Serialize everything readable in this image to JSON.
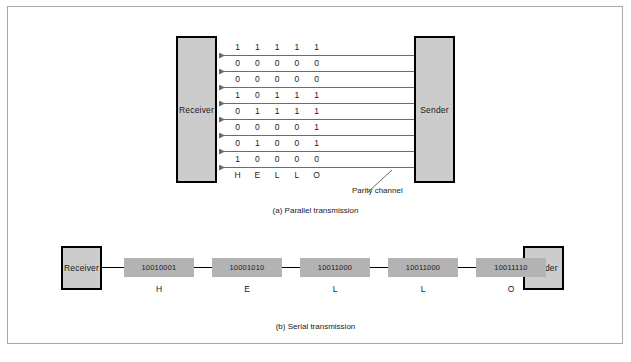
{
  "figure": {
    "panels": [
      {
        "id": "parallel",
        "caption": "(a)  Parallel transmission",
        "receiver_label": "Receiver",
        "sender_label": "Sender",
        "annotation": "Parity channel",
        "letters": [
          "H",
          "E",
          "L",
          "L",
          "O"
        ],
        "bit_rows": [
          [
            "1",
            "1",
            "1",
            "1",
            "1"
          ],
          [
            "0",
            "0",
            "0",
            "0",
            "0"
          ],
          [
            "0",
            "0",
            "0",
            "0",
            "0"
          ],
          [
            "1",
            "0",
            "1",
            "1",
            "1"
          ],
          [
            "0",
            "1",
            "1",
            "1",
            "1"
          ],
          [
            "0",
            "0",
            "0",
            "0",
            "1"
          ],
          [
            "0",
            "1",
            "0",
            "0",
            "1"
          ],
          [
            "1",
            "0",
            "0",
            "0",
            "0"
          ]
        ]
      },
      {
        "id": "serial",
        "caption": "(b)  Serial transmission",
        "receiver_label": "Receiver",
        "sender_label": "Sender",
        "frames": [
          {
            "bits": "10010001",
            "letter": "H"
          },
          {
            "bits": "10001010",
            "letter": "E"
          },
          {
            "bits": "10011000",
            "letter": "L"
          },
          {
            "bits": "10011000",
            "letter": "L"
          },
          {
            "bits": "10011110",
            "letter": "O"
          }
        ]
      }
    ],
    "colors": {
      "node_fill": "#cccccc",
      "frame_fill": "#b3b3b3",
      "line": "#6b6b6b",
      "border": "#000000",
      "outer_frame": "#a8a8a8"
    }
  }
}
